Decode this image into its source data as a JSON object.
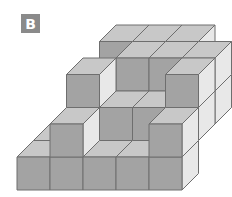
{
  "label": {
    "text": "B",
    "bg": "#8a8a8a",
    "fg": "#ffffff"
  },
  "projection": {
    "origin_x": 17,
    "origin_y": 190,
    "size": 33,
    "depth_dx": 16.5,
    "depth_dy": -16.5
  },
  "colors": {
    "front": "#a3a3a3",
    "top": "#c8c8c8",
    "side": "#e8e8e8",
    "stroke": "#6e6e6e"
  },
  "cubes": [
    [
      0,
      3,
      0
    ],
    [
      1,
      3,
      0
    ],
    [
      2,
      3,
      0
    ],
    [
      3,
      3,
      0
    ],
    [
      0,
      2,
      0
    ],
    [
      1,
      2,
      0
    ],
    [
      2,
      2,
      0
    ],
    [
      3,
      2,
      0
    ],
    [
      0,
      1,
      0
    ],
    [
      1,
      1,
      0
    ],
    [
      2,
      1,
      0
    ],
    [
      3,
      1,
      0
    ],
    [
      1,
      2,
      1
    ],
    [
      2,
      2,
      1
    ],
    [
      3,
      2,
      1
    ],
    [
      1,
      1,
      1
    ],
    [
      2,
      1,
      1
    ],
    [
      3,
      1,
      1
    ],
    [
      4,
      1,
      1
    ],
    [
      1,
      3,
      1
    ],
    [
      2,
      3,
      1
    ],
    [
      3,
      3,
      1
    ],
    [
      4,
      3,
      1
    ],
    [
      1,
      3,
      2
    ],
    [
      2,
      3,
      2
    ],
    [
      3,
      3,
      2
    ],
    [
      4,
      2,
      1
    ],
    [
      4,
      2,
      2
    ],
    [
      2,
      2,
      2
    ],
    [
      3,
      2,
      2
    ],
    [
      4,
      1,
      2
    ],
    [
      1,
      0,
      0
    ],
    [
      2,
      0,
      0
    ],
    [
      3,
      0,
      0
    ],
    [
      0,
      0,
      0
    ],
    [
      1,
      1,
      2
    ],
    [
      1,
      0,
      1
    ],
    [
      4,
      0,
      0
    ],
    [
      4,
      0,
      1
    ]
  ]
}
